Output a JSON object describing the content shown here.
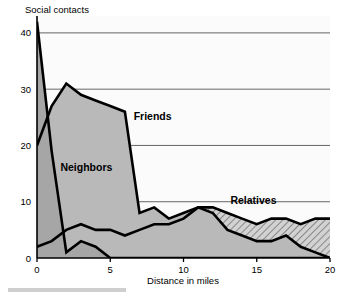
{
  "chart_data": {
    "type": "area",
    "title": "",
    "ylabel": "Social contacts",
    "xlabel": "Distance in miles",
    "xlim": [
      0,
      20
    ],
    "ylim": [
      0,
      43
    ],
    "xticks": [
      0,
      5,
      10,
      15,
      20
    ],
    "yticks": [
      0,
      10,
      20,
      30,
      40
    ],
    "grid": true,
    "legend_position": "inline-annotations",
    "x": [
      0,
      1,
      2,
      3,
      4,
      5,
      6,
      7,
      8,
      9,
      10,
      11,
      12,
      13,
      14,
      15,
      16,
      17,
      18,
      19,
      20
    ],
    "series": [
      {
        "name": "Neighbors",
        "fill": "#9e9e9e",
        "pattern": "solid-gray",
        "values": [
          42,
          19,
          1,
          3,
          2,
          0,
          0,
          0,
          0,
          0,
          0,
          0,
          0,
          0,
          0,
          0,
          0,
          0,
          0,
          0,
          0
        ]
      },
      {
        "name": "Friends",
        "fill": "#b5b5b5",
        "pattern": "solid-light-gray",
        "values": [
          20,
          27,
          31,
          29,
          28,
          27,
          26,
          8,
          9,
          7,
          8,
          9,
          8,
          5,
          4,
          3,
          3,
          4,
          2,
          1,
          0
        ]
      },
      {
        "name": "Relatives",
        "fill": "#c8c8c8",
        "pattern": "diagonal-hatch",
        "values": [
          2,
          3,
          5,
          6,
          5,
          5,
          4,
          5,
          6,
          6,
          7,
          9,
          9,
          8,
          7,
          6,
          7,
          7,
          6,
          7,
          7
        ]
      }
    ],
    "annotations": [
      {
        "text": "Friends",
        "x": 6.6,
        "y": 24.5
      },
      {
        "text": "Neighbors",
        "x": 1.6,
        "y": 15.5
      },
      {
        "text": "Relatives",
        "x": 13.2,
        "y": 9.6
      }
    ]
  },
  "axis": {
    "y_title": "Social contacts",
    "x_title": "Distance in miles",
    "y_tick_labels": [
      "0",
      "10",
      "20",
      "30",
      "40"
    ],
    "x_tick_labels": [
      "0",
      "5",
      "10",
      "15",
      "20"
    ]
  }
}
